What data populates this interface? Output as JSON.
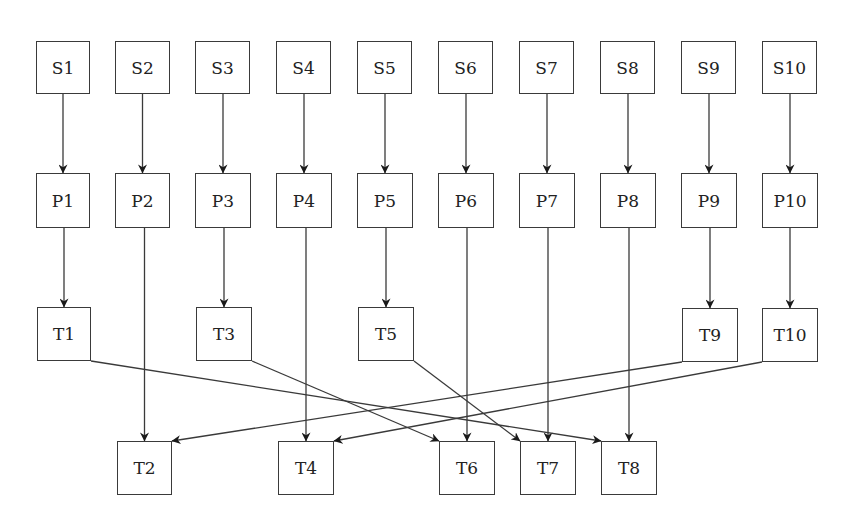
{
  "diagram": {
    "type": "flow",
    "colors": {
      "stroke": "#3a3a3a",
      "text": "#222222",
      "background": "#ffffff"
    },
    "nodes": [
      {
        "id": "S1",
        "label": "S1",
        "x": 36,
        "y": 41,
        "w": 54,
        "h": 53
      },
      {
        "id": "S2",
        "label": "S2",
        "x": 115,
        "y": 41,
        "w": 55,
        "h": 53
      },
      {
        "id": "S3",
        "label": "S3",
        "x": 195,
        "y": 41,
        "w": 55,
        "h": 53
      },
      {
        "id": "S4",
        "label": "S4",
        "x": 276,
        "y": 41,
        "w": 55,
        "h": 53
      },
      {
        "id": "S5",
        "label": "S5",
        "x": 357,
        "y": 41,
        "w": 55,
        "h": 53
      },
      {
        "id": "S6",
        "label": "S6",
        "x": 438,
        "y": 41,
        "w": 55,
        "h": 53
      },
      {
        "id": "S7",
        "label": "S7",
        "x": 519,
        "y": 41,
        "w": 55,
        "h": 53
      },
      {
        "id": "S8",
        "label": "S8",
        "x": 600,
        "y": 41,
        "w": 55,
        "h": 53
      },
      {
        "id": "S9",
        "label": "S9",
        "x": 681,
        "y": 41,
        "w": 55,
        "h": 53
      },
      {
        "id": "S10",
        "label": "S10",
        "x": 762,
        "y": 41,
        "w": 55,
        "h": 53
      },
      {
        "id": "P1",
        "label": "P1",
        "x": 36,
        "y": 173,
        "w": 54,
        "h": 55
      },
      {
        "id": "P2",
        "label": "P2",
        "x": 115,
        "y": 173,
        "w": 55,
        "h": 55
      },
      {
        "id": "P3",
        "label": "P3",
        "x": 195,
        "y": 173,
        "w": 56,
        "h": 55
      },
      {
        "id": "P4",
        "label": "P4",
        "x": 276,
        "y": 173,
        "w": 56,
        "h": 55
      },
      {
        "id": "P5",
        "label": "P5",
        "x": 357,
        "y": 173,
        "w": 56,
        "h": 55
      },
      {
        "id": "P6",
        "label": "P6",
        "x": 438,
        "y": 173,
        "w": 56,
        "h": 55
      },
      {
        "id": "P7",
        "label": "P7",
        "x": 519,
        "y": 173,
        "w": 56,
        "h": 55
      },
      {
        "id": "P8",
        "label": "P8",
        "x": 600,
        "y": 173,
        "w": 56,
        "h": 55
      },
      {
        "id": "P9",
        "label": "P9",
        "x": 681,
        "y": 173,
        "w": 56,
        "h": 55
      },
      {
        "id": "P10",
        "label": "P10",
        "x": 762,
        "y": 173,
        "w": 56,
        "h": 55
      },
      {
        "id": "T1",
        "label": "T1",
        "x": 37,
        "y": 307,
        "w": 54,
        "h": 54
      },
      {
        "id": "T3",
        "label": "T3",
        "x": 196,
        "y": 307,
        "w": 56,
        "h": 54
      },
      {
        "id": "T5",
        "label": "T5",
        "x": 358,
        "y": 307,
        "w": 56,
        "h": 54
      },
      {
        "id": "T9",
        "label": "T9",
        "x": 682,
        "y": 308,
        "w": 56,
        "h": 54
      },
      {
        "id": "T10",
        "label": "T10",
        "x": 762,
        "y": 308,
        "w": 56,
        "h": 54
      },
      {
        "id": "T2",
        "label": "T2",
        "x": 117,
        "y": 441,
        "w": 55,
        "h": 54
      },
      {
        "id": "T4",
        "label": "T4",
        "x": 278,
        "y": 441,
        "w": 56,
        "h": 54
      },
      {
        "id": "T6",
        "label": "T6",
        "x": 439,
        "y": 441,
        "w": 56,
        "h": 54
      },
      {
        "id": "T7",
        "label": "T7",
        "x": 520,
        "y": 441,
        "w": 56,
        "h": 54
      },
      {
        "id": "T8",
        "label": "T8",
        "x": 601,
        "y": 441,
        "w": 56,
        "h": 54
      }
    ],
    "edges": [
      {
        "from": "S1",
        "to": "P1"
      },
      {
        "from": "S2",
        "to": "P2"
      },
      {
        "from": "S3",
        "to": "P3"
      },
      {
        "from": "S4",
        "to": "P4"
      },
      {
        "from": "S5",
        "to": "P5"
      },
      {
        "from": "S6",
        "to": "P6"
      },
      {
        "from": "S7",
        "to": "P7"
      },
      {
        "from": "S8",
        "to": "P8"
      },
      {
        "from": "S9",
        "to": "P9"
      },
      {
        "from": "S10",
        "to": "P10"
      },
      {
        "from": "P1",
        "to": "T1"
      },
      {
        "from": "P2",
        "to": "T2"
      },
      {
        "from": "P3",
        "to": "T3"
      },
      {
        "from": "P4",
        "to": "T4"
      },
      {
        "from": "P5",
        "to": "T5"
      },
      {
        "from": "P6",
        "to": "T6"
      },
      {
        "from": "P7",
        "to": "T7"
      },
      {
        "from": "P8",
        "to": "T8"
      },
      {
        "from": "P9",
        "to": "T9"
      },
      {
        "from": "P10",
        "to": "T10"
      },
      {
        "from": "T1",
        "to": "T8",
        "x1": 91,
        "y1": 361,
        "x2": 601,
        "y2": 441
      },
      {
        "from": "T3",
        "to": "T6",
        "x1": 252,
        "y1": 361,
        "x2": 439,
        "y2": 441
      },
      {
        "from": "T5",
        "to": "T7",
        "x1": 414,
        "y1": 361,
        "x2": 520,
        "y2": 441
      },
      {
        "from": "T9",
        "to": "T2",
        "x1": 682,
        "y1": 362,
        "x2": 172,
        "y2": 441
      },
      {
        "from": "T10",
        "to": "T4",
        "x1": 762,
        "y1": 362,
        "x2": 334,
        "y2": 441
      }
    ]
  }
}
